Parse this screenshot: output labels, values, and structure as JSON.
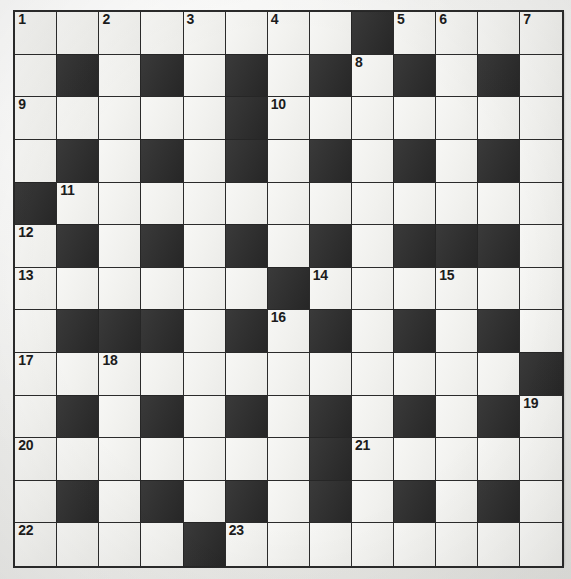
{
  "puzzle": {
    "type": "crossword-grid",
    "title": "Crossword Puzzle Grid",
    "rows": 13,
    "columns": 13,
    "colors": {
      "white_cell": "#f2f2ef",
      "black_cell": "#2e2e2e",
      "grid_line": "#2b2b2b",
      "page_background": "#efefec",
      "number_text": "#1c1c1c"
    },
    "legend": {
      "white": "open letter square",
      "black": "blocked square"
    },
    "grid": [
      [
        "white",
        "white",
        "white",
        "white",
        "white",
        "white",
        "white",
        "white",
        "black",
        "white",
        "white",
        "white",
        "white"
      ],
      [
        "white",
        "black",
        "white",
        "black",
        "white",
        "black",
        "white",
        "black",
        "white",
        "black",
        "white",
        "black",
        "white"
      ],
      [
        "white",
        "white",
        "white",
        "white",
        "white",
        "black",
        "white",
        "white",
        "white",
        "white",
        "white",
        "white",
        "white"
      ],
      [
        "white",
        "black",
        "white",
        "black",
        "white",
        "black",
        "white",
        "black",
        "white",
        "black",
        "white",
        "black",
        "white"
      ],
      [
        "black",
        "white",
        "white",
        "white",
        "white",
        "white",
        "white",
        "white",
        "white",
        "white",
        "white",
        "white",
        "white"
      ],
      [
        "white",
        "black",
        "white",
        "black",
        "white",
        "black",
        "white",
        "black",
        "white",
        "black",
        "black",
        "black",
        "white"
      ],
      [
        "white",
        "white",
        "white",
        "white",
        "white",
        "white",
        "black",
        "white",
        "white",
        "white",
        "white",
        "white",
        "white"
      ],
      [
        "white",
        "black",
        "black",
        "black",
        "white",
        "black",
        "white",
        "black",
        "white",
        "black",
        "white",
        "black",
        "white"
      ],
      [
        "white",
        "white",
        "white",
        "white",
        "white",
        "white",
        "white",
        "white",
        "white",
        "white",
        "white",
        "white",
        "black"
      ],
      [
        "white",
        "black",
        "white",
        "black",
        "white",
        "black",
        "white",
        "black",
        "white",
        "black",
        "white",
        "black",
        "white"
      ],
      [
        "white",
        "white",
        "white",
        "white",
        "white",
        "white",
        "white",
        "black",
        "white",
        "white",
        "white",
        "white",
        "white"
      ],
      [
        "white",
        "black",
        "white",
        "black",
        "white",
        "black",
        "white",
        "black",
        "white",
        "black",
        "white",
        "black",
        "white"
      ],
      [
        "white",
        "white",
        "white",
        "white",
        "black",
        "white",
        "white",
        "white",
        "white",
        "white",
        "white",
        "white",
        "white"
      ]
    ],
    "numbers": [
      {
        "n": "1",
        "row": 1,
        "col": 1
      },
      {
        "n": "2",
        "row": 1,
        "col": 3
      },
      {
        "n": "3",
        "row": 1,
        "col": 5
      },
      {
        "n": "4",
        "row": 1,
        "col": 7
      },
      {
        "n": "5",
        "row": 1,
        "col": 10
      },
      {
        "n": "6",
        "row": 1,
        "col": 11
      },
      {
        "n": "7",
        "row": 1,
        "col": 13
      },
      {
        "n": "8",
        "row": 2,
        "col": 9
      },
      {
        "n": "9",
        "row": 3,
        "col": 1
      },
      {
        "n": "10",
        "row": 3,
        "col": 7
      },
      {
        "n": "11",
        "row": 5,
        "col": 2
      },
      {
        "n": "12",
        "row": 6,
        "col": 1
      },
      {
        "n": "13",
        "row": 7,
        "col": 1
      },
      {
        "n": "14",
        "row": 7,
        "col": 8
      },
      {
        "n": "15",
        "row": 7,
        "col": 11
      },
      {
        "n": "16",
        "row": 8,
        "col": 7
      },
      {
        "n": "17",
        "row": 9,
        "col": 1
      },
      {
        "n": "18",
        "row": 9,
        "col": 3
      },
      {
        "n": "19",
        "row": 10,
        "col": 13
      },
      {
        "n": "20",
        "row": 11,
        "col": 1
      },
      {
        "n": "21",
        "row": 11,
        "col": 9
      },
      {
        "n": "22",
        "row": 13,
        "col": 1
      },
      {
        "n": "23",
        "row": 13,
        "col": 6
      }
    ]
  }
}
